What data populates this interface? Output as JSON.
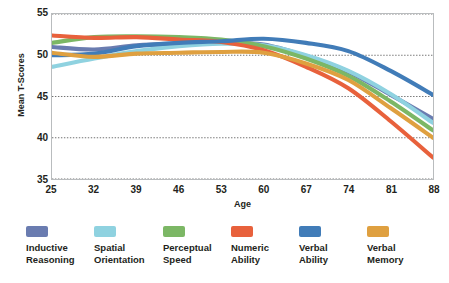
{
  "chart_data": {
    "type": "line",
    "title": "",
    "xlabel": "Age",
    "ylabel": "Mean T-Scores",
    "xlim": [
      25,
      88
    ],
    "ylim": [
      35,
      55
    ],
    "grid": true,
    "grid_axis": "y",
    "legend_position": "bottom",
    "x": [
      25,
      32,
      39,
      46,
      53,
      60,
      67,
      74,
      81,
      88
    ],
    "x_ticks": [
      "25",
      "32",
      "39",
      "46",
      "53",
      "60",
      "67",
      "74",
      "81",
      "88"
    ],
    "y_ticks": [
      "35",
      "40",
      "45",
      "50",
      "55"
    ],
    "series": [
      {
        "name": "Inductive Reasoning",
        "color": "#6a7cb0",
        "values": [
          51.0,
          50.6,
          51.3,
          51.4,
          51.4,
          51.2,
          49.8,
          48.0,
          45.4,
          42.4
        ]
      },
      {
        "name": "Spatial Orientation",
        "color": "#8fd0de",
        "values": [
          48.6,
          49.7,
          50.6,
          51.2,
          51.5,
          51.2,
          49.9,
          48.0,
          45.2,
          42.0
        ]
      },
      {
        "name": "Perceptual Speed",
        "color": "#7db濃"
      }
    ]
  }
}
